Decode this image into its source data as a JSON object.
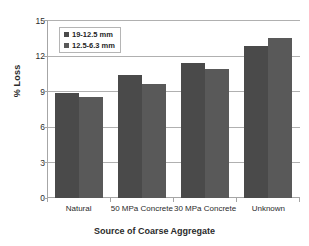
{
  "chart_data": {
    "type": "bar",
    "title": "",
    "xlabel": "Source of Coarse Aggregate",
    "ylabel": "% Loss",
    "categories": [
      "Natural",
      "50 MPa Concrete",
      "30 MPa Concrete",
      "Unknown"
    ],
    "series": [
      {
        "name": "19-12.5 mm",
        "color": "#4a4a4a",
        "values": [
          8.85,
          10.35,
          11.4,
          12.8
        ]
      },
      {
        "name": "12.5-6.3 mm",
        "color": "#595959",
        "values": [
          8.5,
          9.65,
          10.85,
          13.5
        ]
      }
    ],
    "ylim": [
      0,
      15
    ],
    "yticks": [
      0,
      3,
      6,
      9,
      12,
      15
    ],
    "ytick_labels": [
      "0",
      "3",
      "6",
      "9",
      "12",
      "15"
    ],
    "grid": true,
    "legend_position": "top-left-inside",
    "gridline_color": "#b0b0b0",
    "axis_color": "#a6a6a6",
    "background": "#ffffff"
  }
}
